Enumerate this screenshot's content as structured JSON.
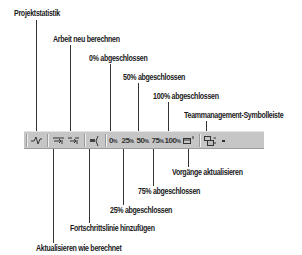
{
  "diagram": {
    "toolbar": {
      "background": "#c6c6c6",
      "buttons": [
        {
          "id": "projektstatistik",
          "icon": "project-statistics-icon",
          "glyph": "-√v"
        },
        {
          "id": "aktualisieren-wie-berechnet",
          "icon": "update-as-scheduled-icon",
          "glyph": "⇥"
        },
        {
          "id": "arbeit-neu-berechnen",
          "icon": "reschedule-work-icon",
          "glyph": "⇥"
        },
        {
          "id": "fortschrittslinie",
          "icon": "add-progress-line-icon",
          "glyph": "◄"
        },
        {
          "id": "pct0",
          "text": "0",
          "sup": "%"
        },
        {
          "id": "pct25",
          "text": "25",
          "sup": "%"
        },
        {
          "id": "pct50",
          "text": "50",
          "sup": "%"
        },
        {
          "id": "pct75",
          "text": "75",
          "sup": "%"
        },
        {
          "id": "pct100",
          "text": "100",
          "sup": "%"
        },
        {
          "id": "vorgaenge-aktualisieren",
          "icon": "update-tasks-icon",
          "glyph": "▭"
        },
        {
          "id": "teammanagement",
          "icon": "workgroup-toolbar-icon",
          "glyph": "⊞"
        },
        {
          "id": "more",
          "icon": "toolbar-options-chevron-icon",
          "glyph": "▾"
        }
      ]
    },
    "callouts_top": [
      {
        "label": "Projektstatistik"
      },
      {
        "label": "Arbeit neu berechnen"
      },
      {
        "label": "0% abgeschlossen"
      },
      {
        "label": "50% abgeschlossen"
      },
      {
        "label": "100% abgeschlossen"
      },
      {
        "label": "Teammanagement-Symbolleiste"
      }
    ],
    "callouts_bottom": [
      {
        "label": "Vorgänge aktualisieren"
      },
      {
        "label": "75% abgeschlossen"
      },
      {
        "label": "25% abgeschlossen"
      },
      {
        "label": "Fortschrittslinie hinzufügen"
      },
      {
        "label": "Aktualisieren wie berechnet"
      }
    ]
  }
}
